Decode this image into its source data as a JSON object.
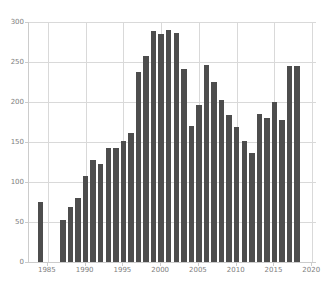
{
  "chart_data": {
    "type": "bar",
    "title": "",
    "subtitle": "",
    "xlabel": "",
    "ylabel": "",
    "xlim": [
      1982.5,
      2020.5
    ],
    "ylim": [
      0,
      300
    ],
    "grid": true,
    "legend": null,
    "bar_color": "#4d4d4d",
    "grid_color": "#d9d9d9",
    "axis_color": "#cccccc",
    "tick_label_color": "#808080",
    "xticks": [
      1985,
      1990,
      1995,
      2000,
      2005,
      2010,
      2015,
      2020
    ],
    "yticks": [
      0,
      50,
      100,
      150,
      200,
      250,
      300
    ],
    "categories": [
      1984,
      1987,
      1988,
      1989,
      1990,
      1991,
      1992,
      1993,
      1994,
      1995,
      1996,
      1997,
      1998,
      1999,
      2000,
      2001,
      2002,
      2003,
      2004,
      2005,
      2006,
      2007,
      2008,
      2009,
      2010,
      2011,
      2012,
      2013,
      2014,
      2015,
      2016,
      2017,
      2018
    ],
    "values": [
      75,
      52,
      69,
      80,
      107,
      128,
      122,
      142,
      143,
      151,
      161,
      238,
      257,
      289,
      285,
      290,
      286,
      241,
      170,
      196,
      246,
      225,
      203,
      184,
      169,
      151,
      136,
      185,
      180,
      200,
      178,
      245,
      245
    ]
  }
}
